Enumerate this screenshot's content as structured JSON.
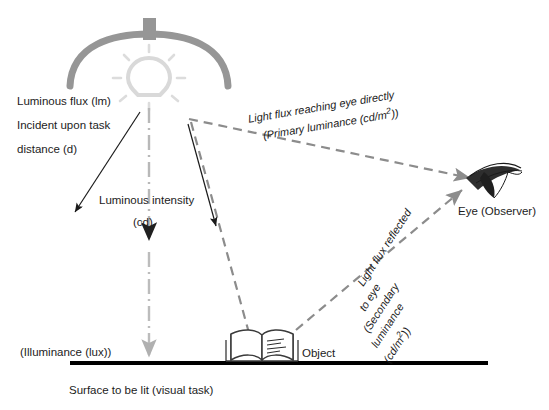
{
  "diagram": {
    "labels": {
      "luminous_flux_l1": "Luminous flux (lm)",
      "luminous_flux_l2": "Incident upon task",
      "luminous_flux_l3": "distance (d)",
      "luminous_intensity_l1": "Luminous intensity",
      "luminous_intensity_l2": "(cd)",
      "illuminance": "(Illuminance (lux))",
      "surface": "Surface to be lit (visual task)",
      "object": "Object",
      "eye": "Eye (Observer)",
      "primary_l1": "Light flux reaching eye directly",
      "primary_l2a": "(Primary luminance (cd/m",
      "primary_l2b": "2",
      "primary_l2c": "))",
      "secondary_l1": "Light flux reflected",
      "secondary_l2": "to eye",
      "secondary_l3": "(Secondary",
      "secondary_l4": "luminance",
      "secondary_l5a": "(cd/m",
      "secondary_l5b": "2",
      "secondary_l5c": "))"
    },
    "colors": {
      "reflector": "#969696",
      "bulb": "#d9d9d9",
      "ray_dashed": "#8c8c8c",
      "arrow_solid": "#1a1a1a",
      "surface": "#000000",
      "dashdot": "#b3b3b3",
      "book_outline": "#3a3a3a"
    }
  }
}
